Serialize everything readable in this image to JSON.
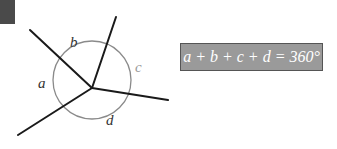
{
  "diagram": {
    "labels": {
      "a": "a",
      "b": "b",
      "c": "c",
      "d": "d"
    },
    "formula": "a + b + c + d = 360°",
    "colors": {
      "lines": "#1a1a1a",
      "circle": "#8a8a8a",
      "label_dark": "#333333",
      "label_light": "#999999",
      "formula_bg": "#9a9a9a",
      "formula_text": "#ffffff",
      "corner_tab": "#4a4a4a"
    }
  }
}
